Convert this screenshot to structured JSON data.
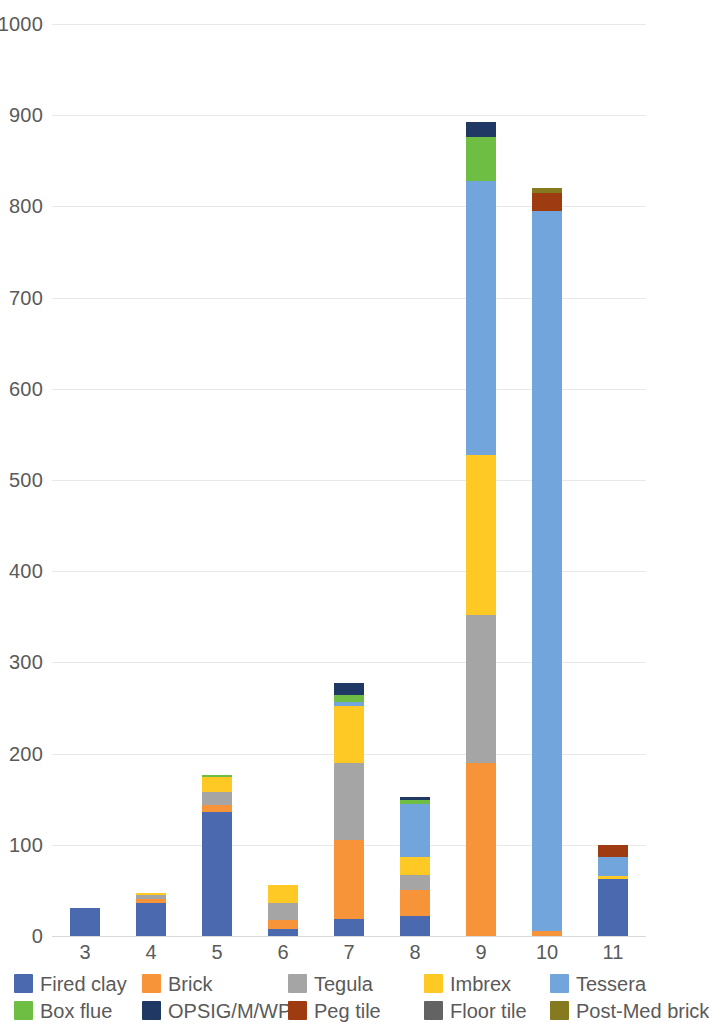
{
  "chart_data": {
    "type": "bar",
    "stacked": true,
    "title": "",
    "xlabel": "",
    "ylabel": "",
    "ylim": [
      0,
      1000
    ],
    "ytick_step": 100,
    "grid": true,
    "legend_position": "bottom",
    "categories": [
      "3",
      "4",
      "5",
      "6",
      "7",
      "8",
      "9",
      "10",
      "11"
    ],
    "ytick_labels": [
      "0",
      "100",
      "200",
      "300",
      "400",
      "500",
      "600",
      "700",
      "800",
      "900",
      "1000"
    ],
    "series": [
      {
        "name": "Fired clay",
        "color": "#4A69AE",
        "values": [
          31,
          36,
          136,
          8,
          19,
          22,
          0,
          0,
          63
        ]
      },
      {
        "name": "Brick",
        "color": "#F79439",
        "values": [
          0,
          5,
          8,
          10,
          86,
          28,
          190,
          5,
          0
        ]
      },
      {
        "name": "Tegula",
        "color": "#A5A5A5",
        "values": [
          0,
          4,
          14,
          18,
          85,
          17,
          162,
          0,
          0
        ]
      },
      {
        "name": "Imbrex",
        "color": "#FFC925",
        "values": [
          0,
          2,
          16,
          20,
          62,
          20,
          175,
          0,
          3
        ]
      },
      {
        "name": "Tessera",
        "color": "#72A5DC",
        "values": [
          0,
          0,
          0,
          0,
          5,
          58,
          301,
          790,
          21
        ]
      },
      {
        "name": "Box flue",
        "color": "#6FBE44",
        "values": [
          0,
          0,
          3,
          0,
          7,
          4,
          48,
          0,
          0
        ]
      },
      {
        "name": "OPSIG/M/WP",
        "color": "#1F3864",
        "values": [
          0,
          0,
          0,
          0,
          14,
          4,
          17,
          0,
          0
        ]
      },
      {
        "name": "Peg tile",
        "color": "#9E3B10",
        "values": [
          0,
          0,
          0,
          0,
          0,
          0,
          0,
          20,
          13
        ]
      },
      {
        "name": "Floor tile",
        "color": "#636363",
        "values": [
          0,
          0,
          0,
          0,
          0,
          0,
          0,
          0,
          0
        ]
      },
      {
        "name": "Post-Med brick",
        "color": "#867A20",
        "values": [
          0,
          0,
          0,
          0,
          0,
          0,
          0,
          5,
          0
        ]
      }
    ],
    "totals": [
      31,
      47,
      177,
      56,
      278,
      153,
      893,
      820,
      100
    ]
  },
  "axis": {
    "y_max": 1000,
    "y_min": 0
  }
}
